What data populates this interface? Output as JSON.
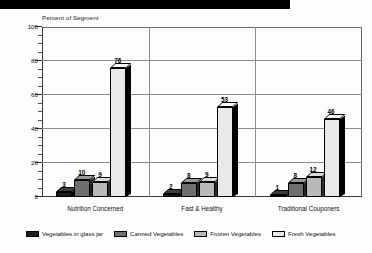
{
  "header": {
    "banner_label": "black-title-banner"
  },
  "chart_data": {
    "type": "bar",
    "title": "",
    "subtitle": "",
    "ylabel": "Percent of Segment",
    "xlabel": "",
    "ylim": [
      0,
      100
    ],
    "yticks": [
      0,
      20,
      40,
      60,
      80,
      100
    ],
    "ytick_labels": [
      "0",
      "20",
      "40",
      "60",
      "80",
      "100"
    ],
    "minor_tick_step": 5,
    "grid": true,
    "legend_position": "bottom",
    "categories": [
      "Nutrition Concerned",
      "Fast & Healthy",
      "Traditional Couponers"
    ],
    "series": [
      {
        "name": "Vegetables in glass jar",
        "color": "#1c1c1c",
        "values": [
          3,
          2,
          1
        ]
      },
      {
        "name": "Canned Vegetables",
        "color": "#6f6f6f",
        "values": [
          10,
          8,
          8
        ]
      },
      {
        "name": "Frozen Vegetables",
        "color": "#b9b9b9",
        "values": [
          9,
          9,
          12
        ]
      },
      {
        "name": "Fresh Vegetables",
        "color": "#e9e9e9",
        "values": [
          76,
          53,
          46
        ]
      }
    ]
  }
}
